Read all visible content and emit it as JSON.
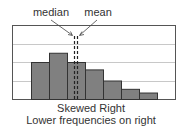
{
  "chart_data": {
    "type": "bar",
    "title": "Skewed Right",
    "subtitle": "Lower frequencies on right",
    "categories": [
      "1",
      "2",
      "3",
      "4",
      "5",
      "6",
      "7"
    ],
    "values": [
      2,
      2.5,
      2,
      1.6,
      1.0,
      0.55,
      0.35
    ],
    "ylim": [
      0,
      4
    ],
    "grid": true,
    "annotations": [
      {
        "label": "median",
        "type": "dashed-vline",
        "x_position": "left of center bar 3"
      },
      {
        "label": "mean",
        "type": "dashed-vline",
        "x_position": "right of median"
      }
    ],
    "xlabel": "",
    "ylabel": ""
  },
  "labels": {
    "median": "median",
    "mean": "mean",
    "caption_line1": "Skewed Right",
    "caption_line2": "Lower frequencies on right"
  },
  "colors": {
    "bar_fill": "#808080",
    "bar_stroke": "#333333",
    "grid": "#c8c8c8",
    "frame": "#555555",
    "text": "#333333"
  }
}
